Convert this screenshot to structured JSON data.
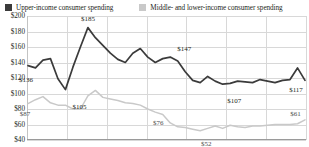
{
  "legend": {
    "items": [
      {
        "label": "Upper-income consumer spending",
        "color": "#3b3b3b",
        "swatch": "legend-swatch-dark"
      },
      {
        "label": "Middle- and lower-income consumer spending",
        "color": "#c9c9c9",
        "swatch": "legend-swatch-light"
      }
    ]
  },
  "axis": {
    "y_ticks": [
      "$200",
      "$180",
      "$160",
      "$140",
      "$120",
      "$100",
      "$80",
      "$60",
      "$40"
    ]
  },
  "chart_data": {
    "type": "line",
    "title": "",
    "xlabel": "",
    "ylabel": "",
    "ylim": [
      40,
      200
    ],
    "ytick_values": [
      200,
      180,
      160,
      140,
      120,
      100,
      80,
      60,
      40
    ],
    "grid": true,
    "legend_position": "top",
    "vertical_gridlines": 7,
    "x": [
      1,
      2,
      3,
      4,
      5,
      6,
      7,
      8,
      9,
      10,
      11,
      12,
      13,
      14,
      15,
      16,
      17,
      18,
      19,
      20,
      21,
      22,
      23,
      24,
      25,
      26,
      27,
      28,
      29,
      30,
      31,
      32,
      33,
      34,
      35,
      36,
      37,
      38
    ],
    "series": [
      {
        "name": "Upper-income consumer spending",
        "color": "#3b3b3b",
        "values": [
          136,
          133,
          143,
          145,
          119,
          105,
          134,
          160,
          185,
          172,
          162,
          152,
          144,
          140,
          152,
          158,
          147,
          140,
          145,
          147,
          142,
          128,
          117,
          114,
          122,
          116,
          112,
          113,
          116,
          115,
          114,
          118,
          116,
          114,
          117,
          118,
          133,
          117
        ],
        "point_labels": [
          {
            "x": 1,
            "value": 136,
            "text": "$136"
          },
          {
            "x": 9,
            "value": 185,
            "text": "$185"
          },
          {
            "x": 6,
            "value": 105,
            "text": "$105"
          },
          {
            "x": 20,
            "value": 147,
            "text": "$147"
          },
          {
            "x": 28,
            "value": 107,
            "text": "$107"
          },
          {
            "x": 38,
            "value": 117,
            "text": "$117"
          }
        ]
      },
      {
        "name": "Middle- and lower-income consumer spending",
        "color": "#c9c9c9",
        "values": [
          87,
          92,
          96,
          88,
          85,
          85,
          80,
          80,
          97,
          104,
          95,
          93,
          91,
          88,
          87,
          85,
          80,
          76,
          73,
          62,
          57,
          56,
          54,
          52,
          55,
          58,
          55,
          59,
          57,
          56,
          58,
          58,
          59,
          60,
          60,
          60,
          61,
          66
        ],
        "point_labels": [
          {
            "x": 1,
            "value": 87,
            "text": "$87"
          },
          {
            "x": 18,
            "value": 76,
            "text": "$76"
          },
          {
            "x": 24,
            "value": 52,
            "text": "$52"
          },
          {
            "x": 37,
            "value": 61,
            "text": "$61"
          }
        ]
      }
    ]
  }
}
